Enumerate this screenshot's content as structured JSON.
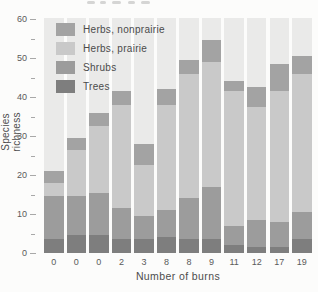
{
  "colors": {
    "herbs_nonprairie": "#a3a3a3",
    "herbs_prairie": "#c9c9c9",
    "shrubs": "#9c9c9c",
    "trees": "#7e7e7e",
    "column_bg": "#eaeae9",
    "text": "#4d4d4d",
    "tick_text": "#5a5a5a",
    "page_bg": "#fcfcfb"
  },
  "chart_data": {
    "type": "bar",
    "stacked": true,
    "title": "",
    "xlabel": "Number of burns",
    "ylabel": "Species richness",
    "ylim": [
      0,
      60
    ],
    "grid": false,
    "y_major_ticks": [
      0,
      10,
      20,
      30,
      40,
      50,
      60
    ],
    "y_minor_ticks": [
      5,
      15,
      25,
      35,
      45,
      55
    ],
    "categories": [
      "0",
      "0",
      "0",
      "2",
      "3",
      "8",
      "8",
      "9",
      "11",
      "12",
      "17",
      "19"
    ],
    "series": [
      {
        "name": "Trees",
        "color_key": "trees",
        "values": [
          3.5,
          4.5,
          4.5,
          3.5,
          3.5,
          4,
          3.5,
          3.5,
          2,
          1.5,
          1.5,
          3.5
        ]
      },
      {
        "name": "Shrubs",
        "color_key": "shrubs",
        "values": [
          11,
          10,
          11,
          8,
          6,
          7,
          10.5,
          13.5,
          5,
          7,
          6.5,
          7
        ]
      },
      {
        "name": "Herbs, prairie",
        "color_key": "herbs_prairie",
        "values": [
          3.5,
          12,
          17,
          26.5,
          13,
          27,
          32,
          32,
          34.5,
          29,
          33.5,
          35.5
        ]
      },
      {
        "name": "Herbs, nonprairie",
        "color_key": "herbs_nonprairie",
        "values": [
          3,
          3,
          3.5,
          3.5,
          5.5,
          4,
          3.5,
          5.5,
          2.5,
          5,
          7,
          4.5
        ]
      }
    ],
    "totals": [
      21,
      29.5,
      36,
      41.5,
      28,
      42,
      49.5,
      54.5,
      44,
      42.5,
      48.5,
      50.5
    ],
    "legend": {
      "position": "top-left",
      "entries": [
        {
          "label": "Herbs, nonprairie",
          "color_key": "herbs_nonprairie"
        },
        {
          "label": "Herbs, prairie",
          "color_key": "herbs_prairie"
        },
        {
          "label": "Shrubs",
          "color_key": "shrubs"
        },
        {
          "label": "Trees",
          "color_key": "trees"
        }
      ]
    }
  }
}
